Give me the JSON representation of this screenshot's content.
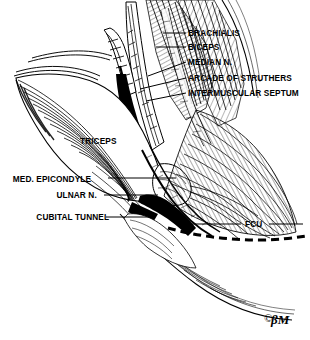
{
  "figure": {
    "kind": "anatomical-line-illustration",
    "width": 310,
    "height": 340,
    "ink_color": "#000000",
    "paper_color": "#ffffff",
    "signature": "BM"
  },
  "labels": {
    "brachialis": "BRACHIALIS",
    "biceps": "BICEPS",
    "median_n": "MEDIAN  N.",
    "arcade_of_struthers": "ARCADE OF STRUTHERS",
    "intermuscular_septum": "INTERMUSCULAR SEPTUM",
    "triceps": "TRICEPS",
    "med_epicondyle": "MED. EPICONDYLE",
    "ulnar_n": "ULNAR N.",
    "cubital_tunnel": "CUBITAL TUNNEL",
    "fcu": "FCU"
  },
  "label_list": [
    {
      "id": "brachialis",
      "text": "BRACHIALIS",
      "side": "right",
      "x": 188,
      "y": 28
    },
    {
      "id": "biceps",
      "text": "BICEPS",
      "side": "right",
      "x": 188,
      "y": 42
    },
    {
      "id": "median-n",
      "text": "MEDIAN  N.",
      "side": "right",
      "x": 188,
      "y": 57
    },
    {
      "id": "arcade-of-struthers",
      "text": "ARCADE OF STRUTHERS",
      "side": "right",
      "x": 188,
      "y": 73
    },
    {
      "id": "intermuscular-septum",
      "text": "INTERMUSCULAR SEPTUM",
      "side": "right",
      "x": 188,
      "y": 88
    },
    {
      "id": "triceps",
      "text": "TRICEPS",
      "side": "none",
      "x": 80,
      "y": 136
    },
    {
      "id": "med-epicondyle",
      "text": "MED. EPICONDYLE",
      "side": "left",
      "x": 105,
      "y": 174
    },
    {
      "id": "ulnar-n",
      "text": "ULNAR N.",
      "side": "left",
      "x": 101,
      "y": 190
    },
    {
      "id": "cubital-tunnel",
      "text": "CUBITAL TUNNEL",
      "side": "left",
      "x": 102,
      "y": 212
    },
    {
      "id": "fcu",
      "text": "FCU",
      "side": "none",
      "x": 245,
      "y": 219
    }
  ],
  "leader_lines": [
    {
      "id": "leader-brachialis",
      "from": [
        163,
        33
      ],
      "to": [
        186,
        33
      ]
    },
    {
      "id": "leader-biceps",
      "from": [
        158,
        47
      ],
      "to": [
        186,
        47
      ]
    },
    {
      "id": "leader-median-n",
      "from": [
        150,
        75
      ],
      "to": [
        186,
        62
      ]
    },
    {
      "id": "leader-arcade-of-struthers",
      "from": [
        143,
        88
      ],
      "to": [
        186,
        78
      ]
    },
    {
      "id": "leader-intermuscular-septum",
      "from": [
        148,
        99
      ],
      "to": [
        186,
        93
      ]
    },
    {
      "id": "leader-med-epicondyle",
      "from": [
        108,
        178
      ],
      "to": [
        172,
        178
      ]
    },
    {
      "id": "leader-ulnar-n",
      "from": [
        104,
        195
      ],
      "to": [
        157,
        195
      ]
    },
    {
      "id": "leader-cubital-tunnel",
      "from": [
        106,
        217
      ],
      "to": [
        150,
        217
      ]
    },
    {
      "id": "leader-fcu",
      "from": [
        190,
        224
      ],
      "to": [
        241,
        224
      ]
    },
    {
      "id": "leader-fcu-right",
      "from": [
        268,
        224
      ],
      "to": [
        300,
        224
      ]
    }
  ],
  "fcu_dashed_border": {
    "id": "fcu-dashed-line",
    "description": "heavy dashed line marking FCU fascial border"
  }
}
